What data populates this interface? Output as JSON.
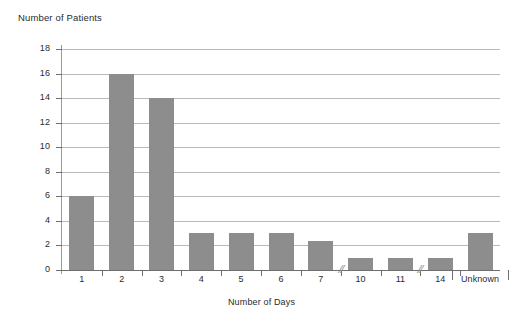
{
  "chart_data": {
    "type": "bar",
    "title": "",
    "ylabel": "Number of Patients",
    "xlabel": "Number of Days",
    "categories": [
      "1",
      "2",
      "3",
      "4",
      "5",
      "6",
      "7",
      "10",
      "11",
      "14",
      "Unknown"
    ],
    "values": [
      6,
      16,
      14,
      3,
      3,
      3,
      2.4,
      1,
      1,
      1,
      3
    ],
    "ylim": [
      0,
      18
    ],
    "ytick_labels": [
      "0",
      "2",
      "4",
      "6",
      "8",
      "10",
      "12",
      "14",
      "16",
      "18"
    ],
    "ytick_values": [
      0,
      2,
      4,
      6,
      8,
      10,
      12,
      14,
      16,
      18
    ],
    "grid": true,
    "legend": "none",
    "axis_breaks": [
      {
        "after_category": "7",
        "glyph": "//"
      },
      {
        "after_category": "11",
        "glyph": "//"
      }
    ],
    "bar_color": "#8d8d8d",
    "gridline_color": "#b9b9b9",
    "axis_color": "#6e6e6e",
    "text_color": "#2b2b2b",
    "background_color": "#ffffff"
  }
}
